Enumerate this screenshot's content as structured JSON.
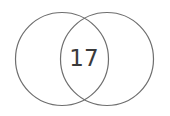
{
  "venn": {
    "left_circle": {
      "cx": 62,
      "cy": 59,
      "r": 47
    },
    "right_circle": {
      "cx": 107,
      "cy": 59,
      "r": 47
    },
    "intersection_label": "17",
    "stroke_color": "#6e6e6e",
    "text_color": "#3a3a3a"
  }
}
